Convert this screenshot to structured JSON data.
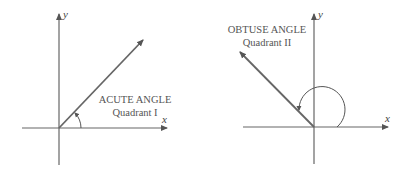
{
  "diagrams": [
    {
      "title": "ACUTE ANGLE",
      "subtitle": "Quadrant I",
      "x_label": "x",
      "y_label": "y"
    },
    {
      "title": "OBTUSE ANGLE",
      "subtitle": "Quadrant II",
      "x_label": "x",
      "y_label": "y"
    }
  ],
  "colors": {
    "line": "#555555",
    "text": "#555555"
  }
}
